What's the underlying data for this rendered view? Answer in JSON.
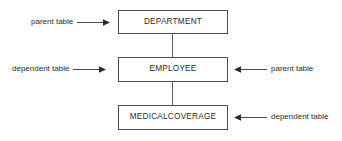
{
  "diagram": {
    "type": "entity-relationship-hierarchy",
    "background_color": "#ffffff",
    "line_color": "#4d4d4d",
    "text_color": "#2b2b2b",
    "entities": [
      {
        "id": "department",
        "label": "DEPARTMENT"
      },
      {
        "id": "employee",
        "label": "EMPLOYEE"
      },
      {
        "id": "medicalcoverage",
        "label": "MEDICALCOVERAGE"
      }
    ],
    "connectors": [
      {
        "id": "department-to-employee",
        "from": "department",
        "to": "employee",
        "style": "plain-line"
      },
      {
        "id": "employee-to-medicalcoverage",
        "from": "employee",
        "to": "medicalcoverage",
        "style": "plain-line"
      }
    ],
    "annotations": [
      {
        "id": "parent-department",
        "label": "parent table",
        "target": "department",
        "side": "left",
        "arrow": "arrow-right-icon"
      },
      {
        "id": "dependent-employee",
        "label": "dependent table",
        "target": "employee",
        "side": "left",
        "arrow": "arrow-right-icon"
      },
      {
        "id": "parent-employee",
        "label": "parent table",
        "target": "employee",
        "side": "right",
        "arrow": "arrow-left-icon"
      },
      {
        "id": "dependent-medicalcoverage",
        "label": "dependent table",
        "target": "medicalcoverage",
        "side": "right",
        "arrow": "arrow-left-icon"
      }
    ]
  }
}
